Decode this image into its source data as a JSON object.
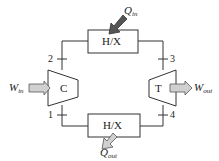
{
  "diagram": {
    "type": "brayton-cycle",
    "components": {
      "heat_exchanger_top": {
        "label": "H/X"
      },
      "heat_exchanger_bottom": {
        "label": "H/X"
      },
      "compressor": {
        "label": "C"
      },
      "turbine": {
        "label": "T"
      }
    },
    "state_points": {
      "p1": "1",
      "p2": "2",
      "p3": "3",
      "p4": "4"
    },
    "flows": {
      "q_in": {
        "symbol": "Q",
        "subscript": "in"
      },
      "q_out": {
        "symbol": "Q",
        "subscript": "out"
      },
      "w_in": {
        "symbol": "W",
        "subscript": "in"
      },
      "w_out": {
        "symbol": "W",
        "subscript": "out"
      }
    },
    "colors": {
      "line": "#333333",
      "q_in_arrow": "#555555",
      "light_arrow": "#d0d0d0",
      "background": "#ffffff"
    }
  }
}
